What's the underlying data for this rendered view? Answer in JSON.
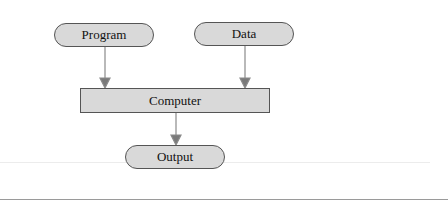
{
  "diagram": {
    "nodes": [
      {
        "id": "program",
        "label": "Program",
        "shape": "pill"
      },
      {
        "id": "data",
        "label": "Data",
        "shape": "pill"
      },
      {
        "id": "computer",
        "label": "Computer",
        "shape": "rect"
      },
      {
        "id": "output",
        "label": "Output",
        "shape": "pill"
      }
    ],
    "edges": [
      {
        "from": "program",
        "to": "computer"
      },
      {
        "from": "data",
        "to": "computer"
      },
      {
        "from": "computer",
        "to": "output"
      }
    ],
    "colors": {
      "node_fill": "#d9d9d9",
      "node_border": "#555555",
      "arrow": "#7a7a7a"
    }
  }
}
